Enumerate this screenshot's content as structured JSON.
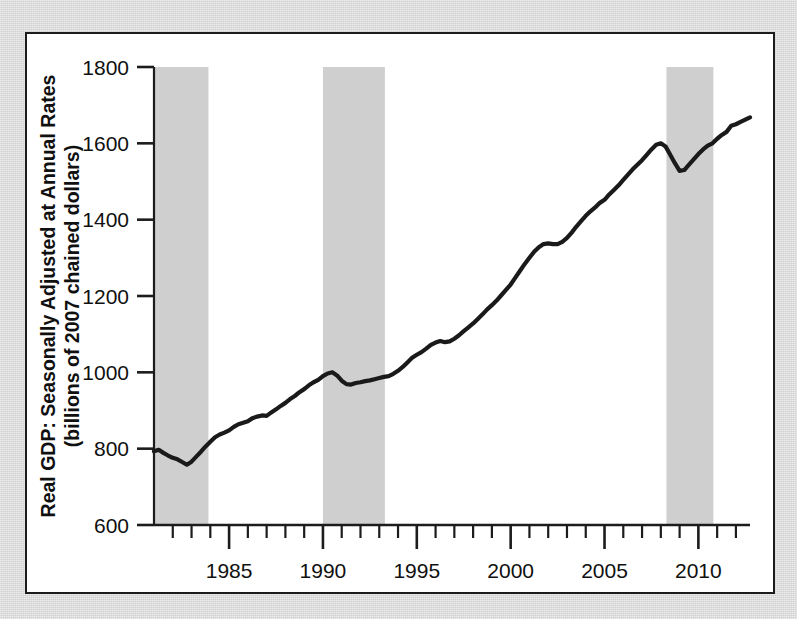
{
  "figure": {
    "background_color": "#d9d9d9",
    "panel_color": "#ffffff",
    "frame_color": "#1c1c1c",
    "series_color": "#1a1a1a",
    "recession_band_color": "#cfcfcf"
  },
  "chart_data": {
    "type": "line",
    "title": "",
    "subtitle": "",
    "xlabel": "",
    "ylabel": "Real GDP: Seasonally Adjusted at Annual Rates",
    "ylabel_line2": "(billions of 2007 chained dollars)",
    "ylabel_lines": [
      "Real GDP: Seasonally Adjusted at Annual Rates",
      "(billions of 2007 chained dollars)"
    ],
    "grid": false,
    "legend": "none",
    "xlim": [
      1981.0,
      2012.75
    ],
    "ylim": [
      600,
      1800
    ],
    "y_ticks": [
      600,
      800,
      1000,
      1200,
      1400,
      1600,
      1800
    ],
    "y_tick_labels": [
      "600",
      "800",
      "1000",
      "1200",
      "1400",
      "1600",
      "1800"
    ],
    "x_major_ticks": [
      1985,
      1990,
      1995,
      2000,
      2005,
      2010
    ],
    "x_major_tick_labels": [
      "1985",
      "1990",
      "1995",
      "2000",
      "2005",
      "2010"
    ],
    "x_minor_tick_step": 1,
    "x_minor_ticks": [
      1982,
      1983,
      1984,
      1986,
      1987,
      1988,
      1989,
      1991,
      1992,
      1993,
      1994,
      1996,
      1997,
      1998,
      1999,
      2001,
      2002,
      2003,
      2004,
      2006,
      2007,
      2008,
      2009,
      2011,
      2012
    ],
    "recession_bands": [
      {
        "label": "1981-82 recession",
        "start": 1981.0,
        "end": 1983.9
      },
      {
        "label": "1990-91 recession",
        "start": 1990.0,
        "end": 1993.3
      },
      {
        "label": "2008-09 recession",
        "start": 2008.3,
        "end": 2010.8
      }
    ],
    "series": [
      {
        "name": "Real GDP",
        "units": "billions of 2007 chained dollars",
        "x": [
          1981.0,
          1981.25,
          1981.5,
          1981.75,
          1982.0,
          1982.25,
          1982.5,
          1982.75,
          1983.0,
          1983.25,
          1983.5,
          1983.75,
          1984.0,
          1984.25,
          1984.5,
          1984.75,
          1985.0,
          1985.25,
          1985.5,
          1985.75,
          1986.0,
          1986.25,
          1986.5,
          1986.75,
          1987.0,
          1987.25,
          1987.5,
          1987.75,
          1988.0,
          1988.25,
          1988.5,
          1988.75,
          1989.0,
          1989.25,
          1989.5,
          1989.75,
          1990.0,
          1990.25,
          1990.5,
          1990.75,
          1991.0,
          1991.25,
          1991.5,
          1991.75,
          1992.0,
          1992.25,
          1992.5,
          1992.75,
          1993.0,
          1993.25,
          1993.5,
          1993.75,
          1994.0,
          1994.25,
          1994.5,
          1994.75,
          1995.0,
          1995.25,
          1995.5,
          1995.75,
          1996.0,
          1996.25,
          1996.5,
          1996.75,
          1997.0,
          1997.25,
          1997.5,
          1997.75,
          1998.0,
          1998.25,
          1998.5,
          1998.75,
          1999.0,
          1999.25,
          1999.5,
          1999.75,
          2000.0,
          2000.25,
          2000.5,
          2000.75,
          2001.0,
          2001.25,
          2001.5,
          2001.75,
          2002.0,
          2002.25,
          2002.5,
          2002.75,
          2003.0,
          2003.25,
          2003.5,
          2003.75,
          2004.0,
          2004.25,
          2004.5,
          2004.75,
          2005.0,
          2005.25,
          2005.5,
          2005.75,
          2006.0,
          2006.25,
          2006.5,
          2006.75,
          2007.0,
          2007.25,
          2007.5,
          2007.75,
          2008.0,
          2008.25,
          2008.5,
          2008.75,
          2009.0,
          2009.25,
          2009.5,
          2009.75,
          2010.0,
          2010.25,
          2010.5,
          2010.75,
          2011.0,
          2011.25,
          2011.5,
          2011.75,
          2012.0,
          2012.25,
          2012.5,
          2012.75
        ],
        "y": [
          793,
          797,
          789,
          782,
          776,
          772,
          765,
          758,
          766,
          779,
          792,
          806,
          818,
          830,
          837,
          842,
          848,
          857,
          864,
          868,
          872,
          880,
          884,
          887,
          886,
          895,
          903,
          912,
          920,
          930,
          938,
          948,
          956,
          966,
          974,
          980,
          990,
          997,
          1000,
          992,
          978,
          969,
          968,
          972,
          974,
          977,
          979,
          982,
          985,
          988,
          990,
          996,
          1004,
          1014,
          1026,
          1038,
          1046,
          1053,
          1062,
          1072,
          1078,
          1082,
          1079,
          1081,
          1088,
          1097,
          1108,
          1118,
          1128,
          1140,
          1152,
          1165,
          1176,
          1188,
          1202,
          1216,
          1230,
          1248,
          1266,
          1284,
          1300,
          1316,
          1328,
          1336,
          1338,
          1336,
          1336,
          1342,
          1352,
          1366,
          1382,
          1396,
          1410,
          1422,
          1432,
          1444,
          1452,
          1466,
          1478,
          1490,
          1504,
          1518,
          1532,
          1544,
          1556,
          1570,
          1584,
          1596,
          1600,
          1592,
          1570,
          1548,
          1528,
          1530,
          1544,
          1558,
          1572,
          1584,
          1594,
          1600,
          1612,
          1622,
          1630,
          1646,
          1650,
          1656,
          1662,
          1668
        ]
      }
    ]
  }
}
